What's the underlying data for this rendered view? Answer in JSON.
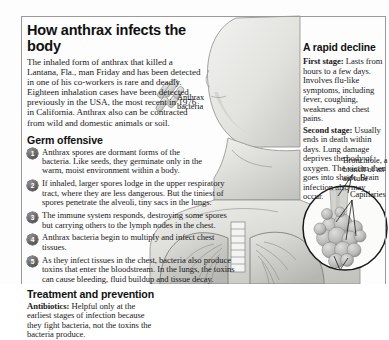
{
  "title": "How anthrax infects the body",
  "lede": "The inhaled form of anthrax that killed a Lantana, Fla., man Friday and has been detected in one of his co-workers is rare and deadly. Eighteen inhalation cases have been detected previously in the USA, the most recent in 1976 in California. Anthrax also can be contracted from wild and domestic animals or soil.",
  "germ_offensive": {
    "heading": "Germ offensive",
    "steps": [
      {
        "num": "1",
        "text": "Anthrax spores are dormant forms of the bacteria.  Like seeds, they germinate only in the warm, moist environment within a body."
      },
      {
        "num": "2",
        "text": "If inhaled, larger spores lodge in the upper respiratory tract, where they are less dangerous. But the tiniest of spores penetrate the alveoli, tiny sacs in the lungs."
      },
      {
        "num": "3",
        "text": "The immune system responds, destroying some spores but carrying others to the lymph nodes in the chest."
      },
      {
        "num": "4",
        "text": "Anthrax bacteria begin to multiply and infect chest tissues."
      },
      {
        "num": "5",
        "text": "As they infect tissues in the chest, bacteria also produce toxins that enter the bloodstream. In the lungs, the toxins can cause bleeding, fluid buildup and tissue decay."
      }
    ]
  },
  "treatment": {
    "heading": "Treatment and prevention",
    "label": "Antibiotics:",
    "text": " Helpful only at the earliest stages of infection because they fight bacteria, not the toxins the bacteria produce."
  },
  "rapid_decline": {
    "heading": "A rapid decline",
    "first_stage_label": "First stage:",
    "first_stage_text": " Lasts from hours to a few days. Involves flu-like symptoms, including fever, coughing, weakness and chest pains.",
    "second_stage_label": "Second stage:",
    "second_stage_text": " Usually ends in death within days. Lung damage deprives the body of oxygen. The victim then goes into shock. Brain infection also may occur."
  },
  "callouts": {
    "anthrax_bacteria": "Anthrax bacteria",
    "bronchiole": "Bronchiole, a branch of an air tube",
    "capillaries": "Capillaries"
  },
  "colors": {
    "frame": "#9a9a9a",
    "text": "#1a1a1a",
    "bullet_dark": "#3c3c3c",
    "illustration_light": "#e8e8e6",
    "illustration_mid": "#c9c9c7",
    "illustration_dark": "#a3a3a1"
  }
}
